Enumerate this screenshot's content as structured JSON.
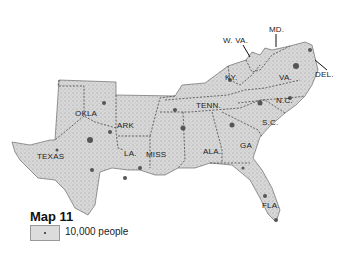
{
  "map": {
    "title": "Map 11",
    "legend": {
      "symbol": "dot",
      "label": "10,000 people"
    },
    "fill_color": "#d8d8d8",
    "dot_color": "#555555",
    "states": [
      {
        "label": "TEXAS",
        "x": 37,
        "y": 152
      },
      {
        "label": "OKLA",
        "x": 75,
        "y": 109
      },
      {
        "label": "ARK",
        "x": 117,
        "y": 121
      },
      {
        "label": "LA.",
        "x": 124,
        "y": 149
      },
      {
        "label": "MISS",
        "x": 146,
        "y": 150
      },
      {
        "label": "ALA.",
        "x": 203,
        "y": 147
      },
      {
        "label": "GA",
        "x": 240,
        "y": 141
      },
      {
        "label": "TENN.",
        "x": 196,
        "y": 101
      },
      {
        "label": "KY.",
        "x": 225,
        "y": 73
      },
      {
        "label": "VA.",
        "x": 279,
        "y": 73
      },
      {
        "label": "N.C.",
        "x": 276,
        "y": 96
      },
      {
        "label": "S.C.",
        "x": 262,
        "y": 118
      },
      {
        "label": "FLA.",
        "x": 262,
        "y": 201
      }
    ],
    "callouts": [
      {
        "label": "W. VA.",
        "x": 223,
        "y": 36
      },
      {
        "label": "MD.",
        "x": 269,
        "y": 25
      },
      {
        "label": "DEL.",
        "x": 315,
        "y": 70
      }
    ]
  }
}
